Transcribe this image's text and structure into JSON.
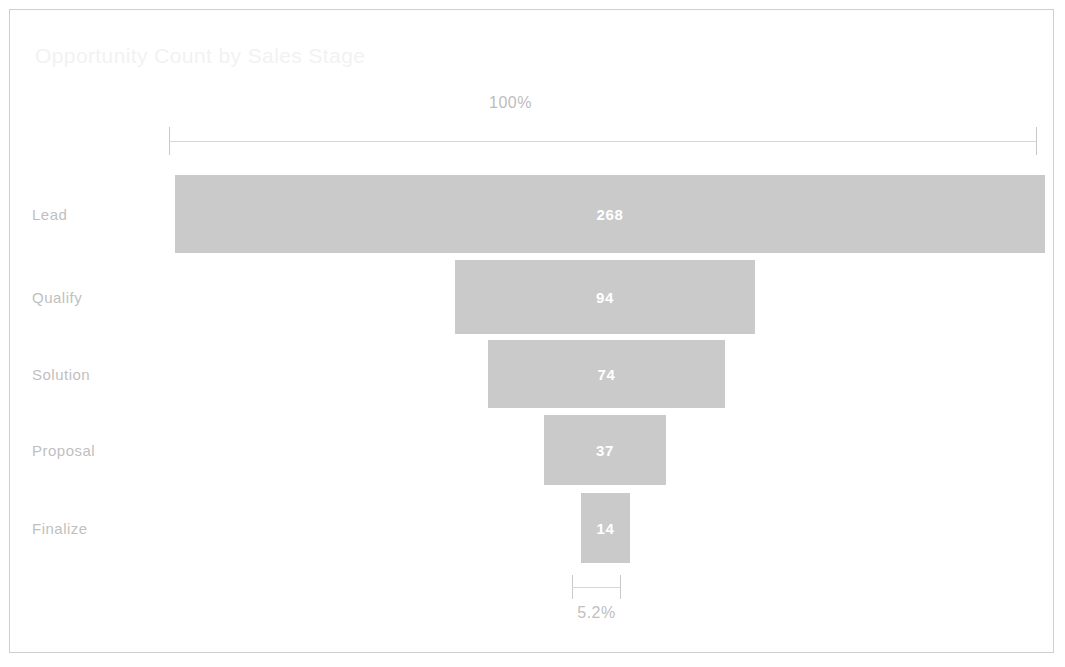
{
  "chart": {
    "title": "Opportunity Count by Sales Stage",
    "top_axis_label": "100%",
    "bottom_axis_label": "5.2%"
  },
  "chart_data": {
    "type": "bar",
    "subtype": "funnel",
    "title": "Opportunity Count by Sales Stage",
    "xlabel": "",
    "ylabel": "",
    "orientation": "horizontal",
    "categories": [
      "Lead",
      "Qualify",
      "Solution",
      "Proposal",
      "Finalize"
    ],
    "values": [
      268,
      94,
      74,
      37,
      14
    ],
    "value_labels": [
      "268",
      "94",
      "74",
      "37",
      "14"
    ],
    "percent_of_first": [
      "100%",
      "35.1%",
      "27.6%",
      "13.8%",
      "5.2%"
    ],
    "annotations": [
      {
        "name": "top-bracket",
        "label": "100%",
        "value": 268,
        "position": "top"
      },
      {
        "name": "bottom-bracket",
        "label": "5.2%",
        "value": 14,
        "position": "bottom"
      }
    ],
    "series": [
      {
        "name": "Opportunity Count",
        "values": [
          268,
          94,
          74,
          37,
          14
        ]
      }
    ],
    "ylim": [
      0,
      268
    ],
    "grid": false,
    "legend": false,
    "bar_color": "#cacaca",
    "value_label_color": "#ffffff",
    "category_label_color": "#bfbfbf",
    "axis_label_color": "#c0c0c0",
    "title_color": "#f2f2f2",
    "background_color": "#ffffff",
    "border_color": "#cfcfcf"
  },
  "rows": [
    {
      "label": "Lead",
      "value": "268",
      "top": 165,
      "height": 78,
      "bar_left": 165,
      "bar_width": 870
    },
    {
      "label": "Qualify",
      "value": "94",
      "top": 250,
      "height": 74,
      "bar_left": 445,
      "bar_width": 300
    },
    {
      "label": "Solution",
      "value": "74",
      "top": 330,
      "height": 68,
      "bar_left": 478,
      "bar_width": 237
    },
    {
      "label": "Proposal",
      "value": "37",
      "top": 405,
      "height": 70,
      "bar_left": 534,
      "bar_width": 122
    },
    {
      "label": "Finalize",
      "value": "14",
      "top": 483,
      "height": 70,
      "bar_left": 571,
      "bar_width": 49
    }
  ]
}
